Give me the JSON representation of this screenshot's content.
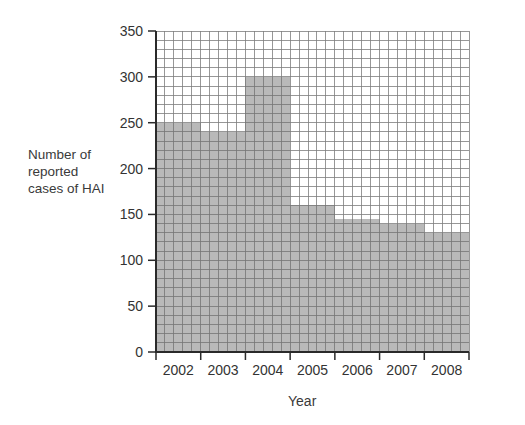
{
  "figure": {
    "y_axis_label_lines": [
      "Number of",
      "reported",
      "cases of HAI"
    ],
    "x_axis_title": "Year"
  },
  "chart_data": {
    "type": "bar",
    "subtype": "frequency-diagram-histogram-on-graph-paper",
    "categories": [
      "2002",
      "2003",
      "2004",
      "2005",
      "2006",
      "2007",
      "2008"
    ],
    "values": [
      250,
      240,
      300,
      160,
      145,
      140,
      130
    ],
    "title": "",
    "xlabel": "Year",
    "ylabel": "Number of reported cases of HAI",
    "ylim": [
      0,
      350
    ],
    "y_ticks": [
      350,
      300,
      250,
      200,
      150,
      100,
      50,
      0
    ],
    "grid": true,
    "grid_minor_unit_y": 10,
    "grid_minor_per_band_x": 5,
    "legend": "none",
    "bars_touch": true,
    "colors": {
      "bar_fill": "#b9b9b9",
      "grid_line": "#6f6f6f",
      "axis_line": "#2a2a2a",
      "text": "#333333",
      "background": "#ffffff"
    }
  }
}
